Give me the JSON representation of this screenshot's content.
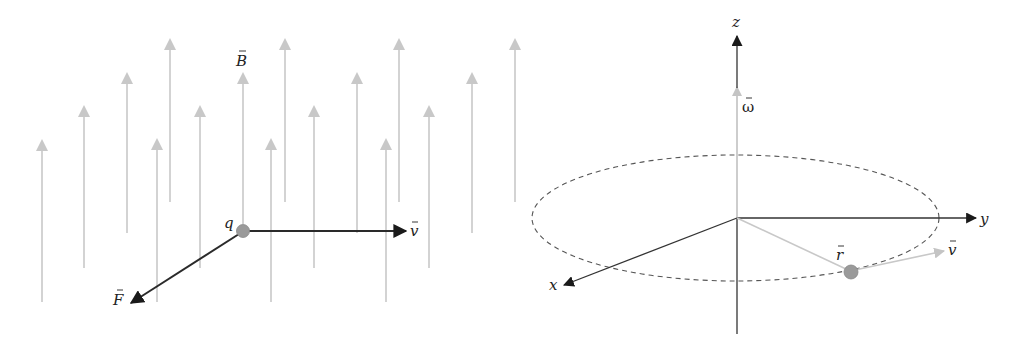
{
  "colors": {
    "field_line": "#c8c8c8",
    "dark_vector": "#2a2a2a",
    "light_vector": "#c4c4c4",
    "charge_fill": "#9a9a9a",
    "charge_stroke": "#888888",
    "orbit_dash": "#555555",
    "axis": "#333333"
  },
  "left_panel": {
    "field_label": "B",
    "charge_label": "q",
    "velocity_label": "v",
    "force_label": "F",
    "field_arrow_count": 17
  },
  "right_panel": {
    "axes": {
      "x": "x",
      "y": "y",
      "z": "z"
    },
    "angular_velocity_label": "ω",
    "radius_label": "r",
    "velocity_label": "v"
  }
}
